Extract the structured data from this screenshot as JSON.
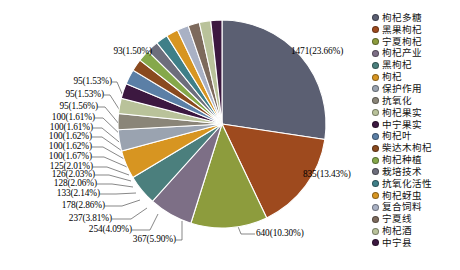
{
  "chart_data": {
    "type": "pie",
    "title": "",
    "subtitle": "",
    "xlabel": "",
    "ylabel": "",
    "legend_position": "right",
    "grid": false,
    "total": 6218,
    "categories": [
      "枸杞多糖",
      "黑果枸杞",
      "宁夏枸杞",
      "枸杞产业",
      "黑枸杞",
      "枸杞",
      "保护作用",
      "抗氧化",
      "枸杞果实",
      "中宁果实",
      "枸杞叶",
      "柴达木枸杞",
      "枸杞种植",
      "栽培技术",
      "抗氧化活性",
      "枸杞蚜虫",
      "复合饲料",
      "宁夏线",
      "枸杞酒",
      "中宁县"
    ],
    "values": [
      1471,
      835,
      640,
      367,
      254,
      237,
      178,
      133,
      128,
      126,
      125,
      100,
      100,
      100,
      100,
      100,
      95,
      95,
      95,
      93
    ],
    "percents": [
      "23.66%",
      "13.43%",
      "10.30%",
      "5.90%",
      "4.09%",
      "3.81%",
      "2.86%",
      "2.14%",
      "2.06%",
      "2.03%",
      "2.01%",
      "1.67%",
      "1.62%",
      "1.62%",
      "1.61%",
      "1.61%",
      "1.56%",
      "1.53%",
      "1.53%",
      "1.50%"
    ],
    "data_labels": [
      "1471(23.66%)",
      "835(13.43%)",
      "640(10.30%)",
      "367(5.90%)",
      "254(4.09%)",
      "237(3.81%)",
      "178(2.86%)",
      "133(2.14%)",
      "128(2.06%)",
      "126(2.03%)",
      "125(2.01%)",
      "100(1.67%)",
      "100(1.62%)",
      "100(1.62%)",
      "100(1.61%)",
      "100(1.61%)",
      "95(1.56%)",
      "95(1.53%)",
      "95(1.53%)",
      "93(1.50%)"
    ],
    "colors": [
      "#5b5f72",
      "#9e4a1e",
      "#8d9c3d",
      "#7d6f86",
      "#4b7f7d",
      "#d79521",
      "#9aa3b0",
      "#8a8578",
      "#b9c29a",
      "#3c1840",
      "#5b7fa6",
      "#8a4a1f",
      "#85a84a",
      "#6d6e7c",
      "#3f7f88",
      "#d79521",
      "#a9b1c4",
      "#7d6a5c",
      "#b9c29a",
      "#3c1840"
    ]
  },
  "legend": {
    "items": [
      {
        "label": "枸杞多糖",
        "color": "#5b5f72"
      },
      {
        "label": "黑果枸杞",
        "color": "#9e4a1e"
      },
      {
        "label": "宁夏枸杞",
        "color": "#8d9c3d"
      },
      {
        "label": "枸杞产业",
        "color": "#7d6f86"
      },
      {
        "label": "黑枸杞",
        "color": "#4b7f7d"
      },
      {
        "label": "枸杞",
        "color": "#d79521"
      },
      {
        "label": "保护作用",
        "color": "#9aa3b0"
      },
      {
        "label": "抗氧化",
        "color": "#8a8578"
      },
      {
        "label": "枸杞果实",
        "color": "#b9c29a"
      },
      {
        "label": "中宁果实",
        "color": "#3c1840"
      },
      {
        "label": "枸杞叶",
        "color": "#5b7fa6"
      },
      {
        "label": "柴达木枸杞",
        "color": "#8a4a1f"
      },
      {
        "label": "枸杞种植",
        "color": "#85a84a"
      },
      {
        "label": "栽培技术",
        "color": "#6d6e7c"
      },
      {
        "label": "抗氧化活性",
        "color": "#3f7f88"
      },
      {
        "label": "枸杞蚜虫",
        "color": "#d79521"
      },
      {
        "label": "复合饲料",
        "color": "#a9b1c4"
      },
      {
        "label": "宁夏线",
        "color": "#7d6a5c"
      },
      {
        "label": "枸杞酒",
        "color": "#b9c29a"
      },
      {
        "label": "中宁县",
        "color": "#3c1840"
      }
    ]
  },
  "labels": {
    "l0": "1471(23.66%)",
    "l1": "835(13.43%)",
    "l2": "640(10.30%)",
    "l3": "367(5.90%)",
    "l4": "254(4.09%)",
    "l5": "237(3.81%)",
    "l6": "178(2.86%)",
    "l7": "133(2.14%)",
    "l8": "128(2.06%)",
    "l9": "126(2.03%)",
    "l10": "125(2.01%)",
    "l11": "100(1.67%)",
    "l12": "100(1.62%)",
    "l13": "100(1.62%)",
    "l14": "100(1.61%)",
    "l15": "100(1.61%)",
    "l16": "95(1.56%)",
    "l17": "95(1.53%)",
    "l18": "95(1.53%)",
    "l19": "93(1.50%)"
  }
}
